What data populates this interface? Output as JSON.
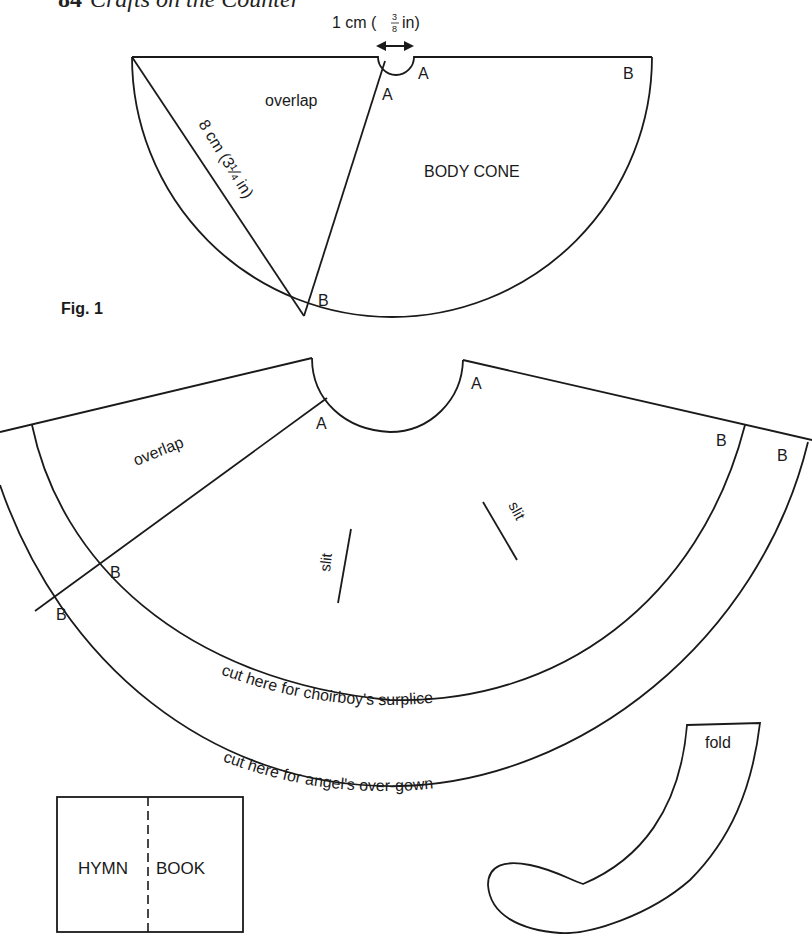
{
  "header": {
    "page_number": "84",
    "book_title": "Crafts on the Counter"
  },
  "figure1": {
    "caption": "Fig. 1",
    "dimension_top": "1 cm (",
    "dimension_top_frac_num": "3",
    "dimension_top_frac_den": "8",
    "dimension_top_unit": "in)",
    "dimension_radius": "8 cm (3¼ in)",
    "label_overlap": "overlap",
    "label_body_cone": "BODY CONE",
    "points": {
      "a_inner": "A",
      "a_outer": "A",
      "b_right": "B",
      "b_bottom": "B"
    }
  },
  "figure2": {
    "label_overlap": "overlap",
    "slit_left": "slit",
    "slit_right": "slit",
    "cut_surplice": "cut here for choirboy's surplice",
    "cut_overgown": "cut here for angel's over-gown",
    "points": {
      "a_left": "A",
      "a_right": "A",
      "b_inner_left": "B",
      "b_outer_left": "B",
      "b_inner_right": "B",
      "b_outer_right": "B"
    }
  },
  "hymn_book": {
    "left": "HYMN",
    "right": "BOOK"
  },
  "sleeve": {
    "label": "fold"
  }
}
